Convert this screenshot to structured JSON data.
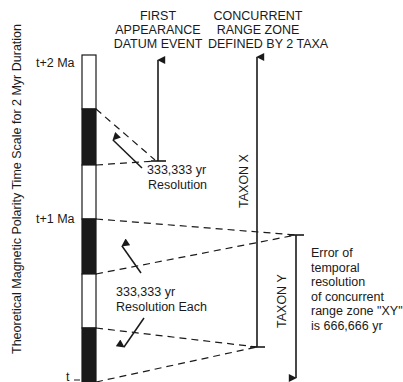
{
  "headers": {
    "fad": [
      "FIRST",
      "APPEARANCE",
      "DATUM EVENT"
    ],
    "crz": [
      "CONCURRENT",
      "RANGE ZONE",
      "DEFINED BY 2 TAXA"
    ]
  },
  "axis": {
    "title": "Theoretical Magnetic Polarity Time Scale for 2 Myr Duration",
    "ticks": [
      {
        "label": "t+2 Ma",
        "y": 62
      },
      {
        "label": "t+1 Ma",
        "y": 219
      },
      {
        "label": "t",
        "y": 378
      }
    ]
  },
  "polarity_column": {
    "segments": [
      {
        "polarity": "normal",
        "color": "#ffffff",
        "y0": 55,
        "y1": 109
      },
      {
        "polarity": "reversed",
        "color": "#1a1a1a",
        "y0": 109,
        "y1": 165
      },
      {
        "polarity": "normal",
        "color": "#ffffff",
        "y0": 165,
        "y1": 219
      },
      {
        "polarity": "reversed",
        "color": "#1a1a1a",
        "y0": 219,
        "y1": 274
      },
      {
        "polarity": "normal",
        "color": "#ffffff",
        "y0": 274,
        "y1": 328
      },
      {
        "polarity": "reversed",
        "color": "#1a1a1a",
        "y0": 328,
        "y1": 382
      }
    ]
  },
  "taxa": {
    "x": "TAXON X",
    "y": "TAXON Y"
  },
  "annotations": {
    "resolution_single": [
      "333,333 yr",
      "Resolution"
    ],
    "resolution_each": [
      "333,333 yr",
      "Resolution Each"
    ],
    "error_note": [
      "Error of",
      "temporal",
      "resolution",
      "of concurrent",
      "range zone \"XY\"",
      "is 666,666 yr"
    ]
  },
  "colors": {
    "ink": "#1a1a1a",
    "background": "#ffffff"
  }
}
